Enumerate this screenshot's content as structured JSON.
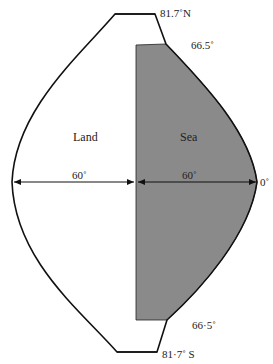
{
  "diagram": {
    "regions": {
      "land": "Land",
      "sea": "Sea"
    },
    "latitudes": {
      "north_pole_limit": "81.7˚N",
      "north_tropic": "66.5˚",
      "south_tropic": "66·5˚",
      "south_pole_limit": "81·7˚ S",
      "equator": "0˚"
    },
    "spans": {
      "land_width": "60˚",
      "sea_width": "60˚"
    },
    "colors": {
      "sea_fill": "#8a8a8a",
      "outline": "#111111",
      "background": "#ffffff"
    }
  }
}
